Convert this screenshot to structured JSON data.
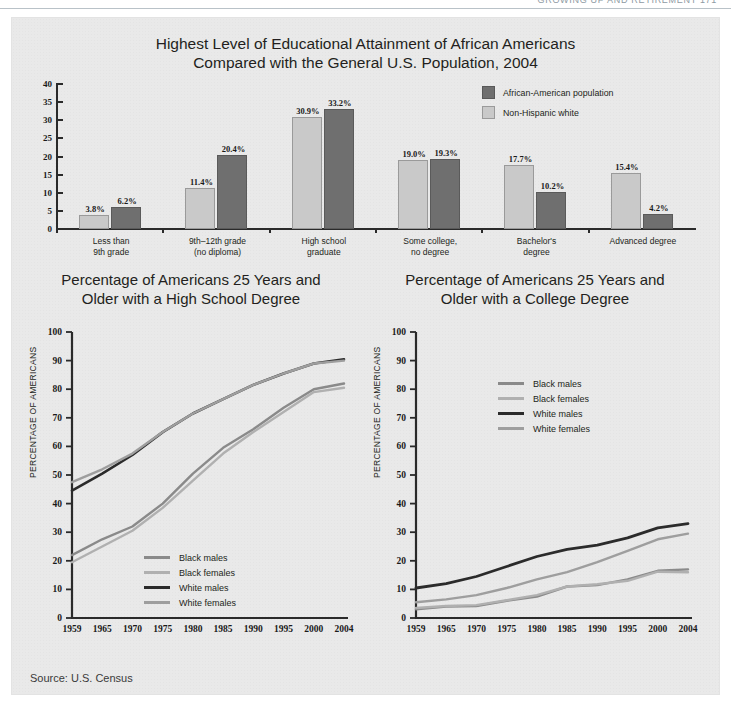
{
  "running_head": {
    "text": "GROWING UP AND RETIREMENT  171"
  },
  "source": {
    "label": "Source: U.S. Census"
  },
  "colors": {
    "panel_bg": "#e9e9e9",
    "bar_dark": "#6f6f6f",
    "bar_light": "#c9c9c9",
    "black_males": "#8a8a8a",
    "black_females": "#b0b0b0",
    "white_males": "#2b2b2b",
    "white_females": "#9e9e9e",
    "axis": "#2a2a2a"
  },
  "chart_data": [
    {
      "id": "bar-chart",
      "type": "bar",
      "title": "Highest Level of Educational Attainment of African Americans Compared with the General U.S. Population, 2004",
      "title_line1": "Highest Level of Educational Attainment of African Americans",
      "title_line2": "Compared with the General U.S. Population, 2004",
      "xlabel": "",
      "ylabel": "",
      "ylim": [
        0,
        40
      ],
      "yticks": [
        40,
        35,
        30,
        25,
        20,
        15,
        10,
        5,
        0
      ],
      "grid": false,
      "legend_position": "top-right",
      "categories": [
        "Less than 9th grade",
        "9th–12th grade (no diploma)",
        "High school graduate",
        "Some college, no degree",
        "Bachelor's degree",
        "Advanced degree"
      ],
      "category_lines": [
        [
          "Less than",
          "9th grade"
        ],
        [
          "9th–12th grade",
          "(no diploma)"
        ],
        [
          "High school",
          "graduate"
        ],
        [
          "Some college,",
          "no degree"
        ],
        [
          "Bachelor's",
          "degree"
        ],
        [
          "Advanced degree",
          ""
        ]
      ],
      "series": [
        {
          "name": "Non-Hispanic white",
          "color": "#c9c9c9",
          "values": [
            3.8,
            11.4,
            30.9,
            19.0,
            17.7,
            15.4
          ],
          "labels": [
            "3.8%",
            "11.4%",
            "30.9%",
            "19.0%",
            "17.7%",
            "15.4%"
          ]
        },
        {
          "name": "African-American population",
          "color": "#6f6f6f",
          "values": [
            6.2,
            20.4,
            33.2,
            19.3,
            10.2,
            4.2
          ],
          "labels": [
            "6.2%",
            "20.4%",
            "33.2%",
            "19.3%",
            "10.2%",
            "4.2%"
          ]
        }
      ],
      "legend": [
        {
          "label": "African-American population",
          "color": "#6f6f6f"
        },
        {
          "label": "Non-Hispanic white",
          "color": "#c9c9c9"
        }
      ]
    },
    {
      "id": "line-chart-highschool",
      "type": "line",
      "title": "Percentage of Americans 25 Years and Older with a High School Degree",
      "title_line1": "Percentage of Americans 25 Years and",
      "title_line2": "Older with a High School Degree",
      "xlabel": "",
      "ylabel": "PERCENTAGE OF AMERICANS",
      "ylim": [
        0,
        100
      ],
      "yticks": [
        0,
        10,
        20,
        30,
        40,
        50,
        60,
        70,
        80,
        90,
        100
      ],
      "x": [
        1959,
        1965,
        1970,
        1975,
        1980,
        1985,
        1990,
        1995,
        2000,
        2004
      ],
      "xticks": [
        "1959",
        "1965",
        "1970",
        "1975",
        "1980",
        "1985",
        "1990",
        "1995",
        "2000",
        "2004"
      ],
      "grid": false,
      "legend_position": "inside-lower-center",
      "series": [
        {
          "name": "Black males",
          "color": "#8a8a8a",
          "width": 2.4,
          "values": [
            22.0,
            27.5,
            32.0,
            40.0,
            50.5,
            59.5,
            66.0,
            73.5,
            80.0,
            82.0
          ]
        },
        {
          "name": "Black females",
          "color": "#b0b0b0",
          "width": 2.4,
          "values": [
            19.5,
            25.0,
            30.5,
            38.5,
            48.0,
            57.5,
            65.0,
            72.0,
            79.0,
            80.5
          ]
        },
        {
          "name": "White males",
          "color": "#2b2b2b",
          "width": 2.6,
          "values": [
            44.5,
            50.5,
            57.0,
            65.0,
            71.5,
            76.5,
            81.5,
            85.5,
            89.0,
            90.5
          ]
        },
        {
          "name": "White females",
          "color": "#9e9e9e",
          "width": 2.4,
          "values": [
            47.5,
            52.0,
            57.5,
            65.0,
            71.5,
            76.5,
            81.5,
            85.5,
            89.0,
            90.0
          ]
        }
      ]
    },
    {
      "id": "line-chart-college",
      "type": "line",
      "title": "Percentage of Americans 25 Years and Older with a College Degree",
      "title_line1": "Percentage of Americans 25 Years and",
      "title_line2": "Older with a College Degree",
      "xlabel": "",
      "ylabel": "PERCENTAGE OF AMERICANS",
      "ylim": [
        0,
        100
      ],
      "yticks": [
        0,
        10,
        20,
        30,
        40,
        50,
        60,
        70,
        80,
        90,
        100
      ],
      "x": [
        1959,
        1965,
        1970,
        1975,
        1980,
        1985,
        1990,
        1995,
        2000,
        2004
      ],
      "xticks": [
        "1959",
        "1965",
        "1970",
        "1975",
        "1980",
        "1985",
        "1990",
        "1995",
        "2000",
        "2004"
      ],
      "grid": false,
      "legend_position": "inside-upper-center",
      "series": [
        {
          "name": "Black males",
          "color": "#8a8a8a",
          "width": 2.4,
          "values": [
            3.0,
            4.0,
            4.2,
            6.0,
            7.5,
            11.0,
            11.5,
            13.5,
            16.5,
            17.0
          ]
        },
        {
          "name": "Black females",
          "color": "#b0b0b0",
          "width": 2.4,
          "values": [
            3.5,
            4.2,
            4.5,
            6.2,
            8.0,
            11.0,
            11.8,
            13.0,
            16.2,
            16.0
          ]
        },
        {
          "name": "White males",
          "color": "#2b2b2b",
          "width": 2.8,
          "values": [
            10.5,
            12.0,
            14.5,
            18.0,
            21.5,
            24.0,
            25.5,
            28.0,
            31.5,
            33.0
          ]
        },
        {
          "name": "White females",
          "color": "#9e9e9e",
          "width": 2.4,
          "values": [
            5.5,
            6.5,
            8.0,
            10.5,
            13.5,
            16.0,
            19.5,
            23.5,
            27.5,
            29.5
          ]
        }
      ]
    }
  ]
}
